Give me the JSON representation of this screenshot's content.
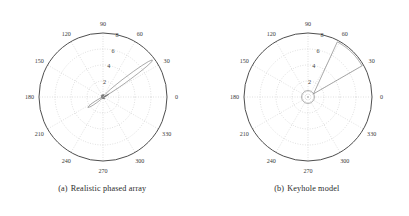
{
  "figure": {
    "panels": [
      {
        "id": "realistic-phased-array",
        "caption_index": "(a)",
        "caption_text": "Realistic phased array",
        "chart_data": {
          "type": "line",
          "plot_kind": "polar-antenna-pattern",
          "title": "Realistic phased array",
          "angular_unit": "degrees",
          "angular_ticks": [
            0,
            30,
            60,
            90,
            120,
            150,
            180,
            210,
            240,
            270,
            300,
            330
          ],
          "angular_tick_labels": [
            "0",
            "30",
            "60",
            "90",
            "120",
            "150",
            "180",
            "210",
            "240",
            "270",
            "300",
            "330"
          ],
          "radial_ticks": [
            2,
            4,
            6,
            8
          ],
          "radial_tick_labels": [
            "2",
            "4",
            "6",
            "8"
          ],
          "radial_label_angle": 75,
          "rlim": [
            0,
            8
          ],
          "grid": true,
          "legend": "none",
          "series": [
            {
              "name": "gain pattern",
              "color": "#777777",
              "description": "Narrow main lobe toward 35 deg reaching r=7.7, with a rear sidelobe toward 215 deg and small sidelobes near the origin",
              "theta": [
                0,
                2,
                4,
                6,
                8,
                10,
                12,
                14,
                16,
                18,
                20,
                22,
                24,
                26,
                28,
                30,
                31,
                32,
                33,
                34,
                35,
                36,
                37,
                38,
                39,
                40,
                42,
                44,
                46,
                48,
                50,
                52,
                54,
                56,
                58,
                60,
                64,
                68,
                72,
                76,
                80,
                84,
                88,
                92,
                96,
                100,
                104,
                108,
                112,
                116,
                120,
                124,
                128,
                132,
                136,
                140,
                144,
                148,
                152,
                156,
                160,
                164,
                168,
                172,
                176,
                180,
                184,
                188,
                192,
                196,
                200,
                204,
                206,
                208,
                210,
                212,
                214,
                215,
                216,
                218,
                220,
                222,
                224,
                226,
                228,
                230,
                232,
                234,
                236,
                238,
                240,
                244,
                248,
                252,
                256,
                260,
                264,
                268,
                272,
                276,
                280,
                284,
                288,
                292,
                296,
                300,
                304,
                308,
                312,
                316,
                320,
                324,
                328,
                332,
                336,
                340,
                344,
                348,
                352,
                356,
                360
              ],
              "r": [
                0.1,
                0.12,
                0.18,
                0.1,
                0.22,
                0.14,
                0.3,
                0.18,
                0.42,
                0.22,
                0.58,
                0.3,
                0.8,
                0.4,
                1.1,
                1.7,
                2.3,
                3.1,
                4.1,
                5.4,
                6.7,
                7.6,
                7.7,
                7.2,
                6.2,
                5.0,
                3.2,
                2.0,
                1.3,
                0.85,
                0.6,
                0.42,
                0.3,
                0.22,
                0.18,
                0.14,
                0.2,
                0.12,
                0.26,
                0.14,
                0.3,
                0.16,
                0.34,
                0.18,
                0.3,
                0.16,
                0.26,
                0.14,
                0.22,
                0.12,
                0.26,
                0.14,
                0.22,
                0.12,
                0.2,
                0.12,
                0.24,
                0.14,
                0.2,
                0.12,
                0.18,
                0.1,
                0.2,
                0.12,
                0.16,
                0.1,
                0.16,
                0.12,
                0.2,
                0.12,
                0.24,
                0.4,
                0.7,
                1.1,
                1.6,
                2.0,
                2.25,
                2.3,
                2.2,
                1.9,
                1.5,
                1.1,
                0.8,
                0.55,
                0.4,
                0.3,
                0.22,
                0.18,
                0.14,
                0.12,
                0.16,
                0.1,
                0.18,
                0.12,
                0.16,
                0.1,
                0.18,
                0.12,
                0.22,
                0.14,
                0.2,
                0.12,
                0.24,
                0.14,
                0.26,
                0.16,
                0.28,
                0.16,
                0.24,
                0.14,
                0.22,
                0.12,
                0.18,
                0.1,
                0.14,
                0.1,
                0.1
              ]
            }
          ]
        }
      },
      {
        "id": "keyhole-model",
        "caption_index": "(b)",
        "caption_text": "Keyhole model",
        "chart_data": {
          "type": "line",
          "plot_kind": "polar-antenna-pattern",
          "title": "Keyhole model",
          "angular_unit": "degrees",
          "angular_ticks": [
            0,
            30,
            60,
            90,
            120,
            150,
            180,
            210,
            240,
            270,
            300,
            330
          ],
          "angular_tick_labels": [
            "0",
            "30",
            "60",
            "90",
            "120",
            "150",
            "180",
            "210",
            "240",
            "270",
            "300",
            "330"
          ],
          "radial_ticks": [
            2,
            4,
            6,
            8
          ],
          "radial_tick_labels": [
            "2",
            "4",
            "6",
            "8"
          ],
          "radial_label_angle": 75,
          "rlim": [
            0,
            8
          ],
          "grid": true,
          "legend": "none",
          "series": [
            {
              "name": "keyhole beam sector",
              "color": "#777777",
              "description": "Idealised flat-topped main beam: constant r=7.8 between 30 deg and 62 deg, dropping to the sidelobe floor elsewhere",
              "beam_start_deg": 30,
              "beam_end_deg": 62,
              "beam_level": 7.8,
              "sidelobe_level": 0.8
            },
            {
              "name": "sidelobe floor circle",
              "color": "#777777",
              "description": "Constant-level omnidirectional sidelobe floor drawn as a small circle of radius 0.8 about the origin",
              "level": 0.8
            }
          ]
        }
      }
    ]
  },
  "style": {
    "axis_color": "#3a3a3a",
    "grid_color": "#b9b9b9",
    "data_color": "#7a7a7a",
    "label_color": "#3a3a3a",
    "caption_color": "#2b2b2b",
    "background": "#ffffff"
  }
}
